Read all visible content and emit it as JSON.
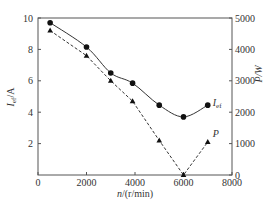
{
  "chart_data": {
    "type": "line",
    "title": "",
    "xlabel": "n/(r/min)",
    "ylabel": "Ief/A",
    "ylabel_right": "P/W",
    "xlim": [
      0,
      8000
    ],
    "ylim": [
      0,
      10
    ],
    "ylim_right": [
      0,
      5000
    ],
    "x_ticks": [
      0,
      2000,
      4000,
      6000,
      8000
    ],
    "y_ticks": [
      2,
      4,
      6,
      8,
      10
    ],
    "y_ticks_right": [
      0,
      1000,
      2000,
      3000,
      4000,
      5000
    ],
    "grid": false,
    "legend": "inline labels at right end of each series",
    "x": [
      500,
      2000,
      3000,
      3900,
      5000,
      6000,
      7000
    ],
    "series": [
      {
        "name": "Ief",
        "label": "I",
        "label_sub": "ef",
        "axis": "left",
        "marker": "circle",
        "line_style": "solid",
        "values": [
          9.7,
          8.15,
          6.5,
          5.85,
          4.45,
          3.7,
          4.45
        ]
      },
      {
        "name": "P",
        "label": "P",
        "axis": "right",
        "marker": "triangle",
        "line_style": "dashed",
        "values": [
          4600,
          3800,
          3000,
          2350,
          1100,
          0,
          1050
        ]
      }
    ]
  },
  "labels": {
    "xlabel_italic": "n",
    "xlabel_rest": "/(r/min)",
    "ylabel_main": "I",
    "ylabel_sub": "ef",
    "ylabel_unit": "/A",
    "ylabel_right": "P/W"
  },
  "colors": {
    "axis": "#555555",
    "line": "#333333",
    "marker": "#111111",
    "text": "#333333"
  }
}
